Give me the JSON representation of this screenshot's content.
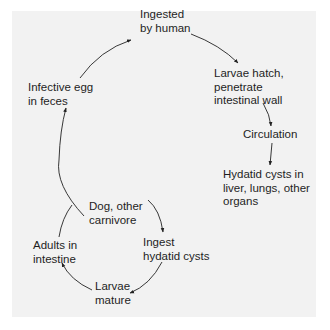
{
  "diagram": {
    "type": "life-cycle",
    "nodes": {
      "ingested": {
        "lines": [
          "Ingested",
          "by human"
        ]
      },
      "larvae_hatch": {
        "lines": [
          "Larvae hatch,",
          "penetrate",
          "intestinal wall"
        ]
      },
      "circulation": {
        "lines": [
          "Circulation"
        ]
      },
      "hydatid_cysts": {
        "lines": [
          "Hydatid cysts in",
          "liver, lungs, other",
          "organs"
        ]
      },
      "infective_egg": {
        "lines": [
          "Infective egg",
          "in feces"
        ]
      },
      "dog": {
        "lines": [
          "Dog, other",
          "carnivore"
        ]
      },
      "adults": {
        "lines": [
          "Adults in",
          "intestine"
        ]
      },
      "ingest_cysts": {
        "lines": [
          "Ingest",
          "hydatid cysts"
        ]
      },
      "larvae_mature": {
        "lines": [
          "Larvae",
          "mature"
        ]
      }
    },
    "edges": [
      [
        "infective_egg",
        "ingested"
      ],
      [
        "ingested",
        "larvae_hatch"
      ],
      [
        "larvae_hatch",
        "circulation"
      ],
      [
        "circulation",
        "hydatid_cysts"
      ],
      [
        "dog",
        "ingest_cysts"
      ],
      [
        "ingest_cysts",
        "larvae_mature"
      ],
      [
        "larvae_mature",
        "adults"
      ],
      [
        "adults",
        "dog"
      ],
      [
        "dog",
        "infective_egg"
      ]
    ],
    "colors": {
      "panel": "#f2f2f2",
      "text": "#1e1e1e",
      "arrow": "#222222"
    }
  }
}
